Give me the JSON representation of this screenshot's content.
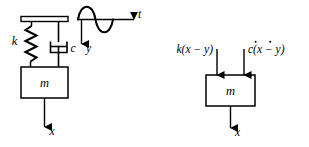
{
  "figure": {
    "stroke_color": "#000000",
    "background_color": "#ffffff"
  },
  "physical_model": {
    "name": "Base-excited spring-mass-damper schematic",
    "support_bar": {
      "label": ""
    },
    "spring": {
      "label": "k",
      "coils": 6
    },
    "damper": {
      "label": "c",
      "type": "dashpot"
    },
    "mass": {
      "label": "m"
    },
    "base_motion": {
      "label": "y",
      "direction": "down"
    },
    "mass_motion": {
      "label": "x",
      "direction": "down"
    },
    "excitation_plot": {
      "axis_label": "t",
      "waveform": "sine"
    }
  },
  "free_body_diagram": {
    "name": "Free-body diagram of mass m",
    "mass": {
      "label": "m"
    },
    "spring_force": {
      "label": "k(x − y)",
      "direction": "up"
    },
    "damper_force": {
      "label": "c(ẋ − ẏ)",
      "label_parts": {
        "coefficient": "c(",
        "xdot": "x",
        "operator": " − ",
        "ydot": "y",
        "close": ")"
      },
      "direction": "up"
    },
    "displacement": {
      "label": "x",
      "direction": "down"
    }
  }
}
